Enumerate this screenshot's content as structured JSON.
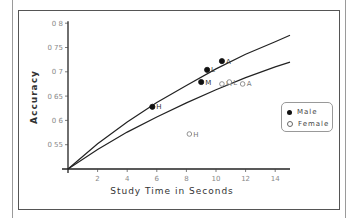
{
  "chart_data": {
    "type": "scatter",
    "title": "",
    "xlabel": "Study Time in Seconds",
    "ylabel": "Accuracy",
    "xlim": [
      0,
      15
    ],
    "ylim": [
      0.5,
      0.8
    ],
    "x_ticks": [
      "2",
      "4",
      "6",
      "8",
      "10",
      "12",
      "14"
    ],
    "y_ticks": [
      "0.55",
      "0.6",
      "0.65",
      "0.7",
      "0.75",
      "0.8"
    ],
    "grid": false,
    "legend_position": "right",
    "series": [
      {
        "name": "Male",
        "marker": "filled-circle",
        "points": [
          {
            "label": "H",
            "x": 5.7,
            "y": 0.628
          },
          {
            "label": "M",
            "x": 9.0,
            "y": 0.679
          },
          {
            "label": "L",
            "x": 9.4,
            "y": 0.704
          },
          {
            "label": "A",
            "x": 10.4,
            "y": 0.722
          }
        ]
      },
      {
        "name": "Female",
        "marker": "open-circle",
        "points": [
          {
            "label": "H",
            "x": 8.2,
            "y": 0.572
          },
          {
            "label": "M",
            "x": 10.4,
            "y": 0.675
          },
          {
            "label": "L",
            "x": 10.9,
            "y": 0.679
          },
          {
            "label": "A",
            "x": 11.8,
            "y": 0.675
          }
        ]
      }
    ],
    "curves": [
      {
        "name": "upper fit",
        "points": [
          [
            0,
            0.5
          ],
          [
            2,
            0.552
          ],
          [
            4,
            0.597
          ],
          [
            6,
            0.637
          ],
          [
            8,
            0.672
          ],
          [
            10,
            0.706
          ],
          [
            12,
            0.736
          ],
          [
            14,
            0.762
          ],
          [
            15,
            0.775
          ]
        ]
      },
      {
        "name": "lower fit",
        "points": [
          [
            0,
            0.5
          ],
          [
            2,
            0.54
          ],
          [
            4,
            0.576
          ],
          [
            6,
            0.607
          ],
          [
            8,
            0.636
          ],
          [
            10,
            0.663
          ],
          [
            12,
            0.688
          ],
          [
            14,
            0.71
          ],
          [
            15,
            0.72
          ]
        ]
      }
    ]
  },
  "legend": {
    "male": "Male",
    "female": "Female"
  },
  "axis": {
    "xlabel": "Study Time in Seconds",
    "ylabel": "Accuracy"
  }
}
